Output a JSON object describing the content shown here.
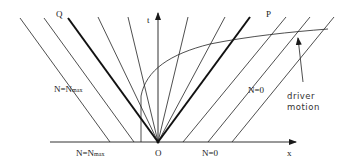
{
  "diagram": {
    "type": "spacetime characteristic diagram",
    "axes": {
      "x_label": "x",
      "t_label": "t",
      "origin_label": "O"
    },
    "thick_lines": {
      "left": "Q",
      "right": "P"
    },
    "region_labels": {
      "upper_left": "N=N",
      "upper_left_sub": "max",
      "upper_right": "N=0",
      "axis_left": "N=N",
      "axis_left_sub": "max",
      "axis_right": "N=0"
    },
    "annotation": {
      "line1": "driver",
      "line2": "motion"
    },
    "colors": {
      "stroke": "#1a1a1a",
      "background": "#ffffff"
    }
  }
}
